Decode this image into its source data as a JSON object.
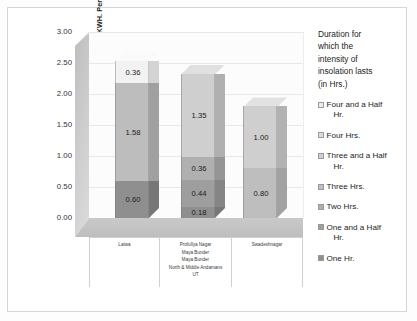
{
  "chart_data": {
    "type": "bar",
    "subtype": "stacked-3d-column",
    "title": "",
    "ylabel": "Intensity of Solar Radiation in KWH. Per day",
    "xlabel": "",
    "ylim": [
      0,
      3.0
    ],
    "ytick_labels": [
      "3.00",
      "2.50",
      "2.00",
      "1.50",
      "1.00",
      "0.50",
      "0.00"
    ],
    "ytick_values": [
      3.0,
      2.5,
      2.0,
      1.5,
      1.0,
      0.5,
      0.0
    ],
    "grid": true,
    "legend_position": "right",
    "legend_title": "Duration for which the intensity of insolation lasts (in Hrs.)",
    "categories": [
      "Latwa",
      "Profullya Nagar",
      "Swadeshnagar"
    ],
    "category_hierarchy": [
      [
        "Latwa"
      ],
      [
        "Profullya Nagar",
        "Maya Bunder",
        "Maya Bunder",
        "North & Middle Andamans",
        "UT"
      ],
      [
        "Swadeshnagar"
      ]
    ],
    "series": [
      {
        "name": "One Hr.",
        "values": [
          0.6,
          0.18,
          0.8
        ],
        "color": "#8f8f8f"
      },
      {
        "name": "One and a Half Hr.",
        "values": [
          null,
          0.44,
          null
        ],
        "color": "#9e9e9e"
      },
      {
        "name": "Two Hrs.",
        "values": [
          null,
          0.36,
          null
        ],
        "color": "#b0b0b0"
      },
      {
        "name": "Three Hrs.",
        "values": [
          1.58,
          null,
          null
        ],
        "color": "#bdbdbd"
      },
      {
        "name": "Three and a Half Hr.",
        "values": [
          null,
          1.35,
          1.0
        ],
        "color": "#cccccc"
      },
      {
        "name": "Four Hrs.",
        "values": [
          null,
          null,
          null
        ],
        "color": "#dcdcdc"
      },
      {
        "name": "Four and a Half Hr.",
        "values": [
          0.36,
          null,
          null
        ],
        "color": "#f2f2f2"
      }
    ],
    "bars": [
      {
        "category": "Latwa",
        "total": 2.54,
        "segments": [
          {
            "label": "0.60",
            "value": 0.6,
            "series": "One Hr.",
            "color": "#8f8f8f",
            "side": "#777777",
            "top": "#a8a8a8"
          },
          {
            "label": "1.58",
            "value": 1.58,
            "series": "Three Hrs.",
            "color": "#bdbdbd",
            "side": "#a0a0a0",
            "top": "#d2d2d2"
          },
          {
            "label": "0.36",
            "value": 0.36,
            "series": "Four and a Half Hr.",
            "color": "#f2f2f2",
            "side": "#d3d3d3",
            "top": "#fafafa"
          }
        ]
      },
      {
        "category": "Profullya Nagar",
        "total": 2.33,
        "segments": [
          {
            "label": "0.18",
            "value": 0.18,
            "series": "One Hr.",
            "color": "#8f8f8f",
            "side": "#777777",
            "top": "#a8a8a8"
          },
          {
            "label": "0.44",
            "value": 0.44,
            "series": "One and a Half Hr.",
            "color": "#9e9e9e",
            "side": "#858585",
            "top": "#b4b4b4"
          },
          {
            "label": "0.36",
            "value": 0.36,
            "series": "Two Hrs.",
            "color": "#b0b0b0",
            "side": "#959595",
            "top": "#c6c6c6"
          },
          {
            "label": "1.35",
            "value": 1.35,
            "series": "Three and a Half Hr.",
            "color": "#cfcfcf",
            "side": "#b0b0b0",
            "top": "#e0e0e0"
          }
        ]
      },
      {
        "category": "Swadeshnagar",
        "total": 1.8,
        "segments": [
          {
            "label": "0.80",
            "value": 0.8,
            "series": "One Hr.",
            "color": "#bebebe",
            "side": "#a2a2a2",
            "top": "#d2d2d2"
          },
          {
            "label": "1.00",
            "value": 1.0,
            "series": "Three and a Half Hr.",
            "color": "#cfcfcf",
            "side": "#b2b2b2",
            "top": "#e2e2e2"
          }
        ]
      }
    ]
  },
  "legend": {
    "title_lines": [
      "Duration for",
      "which the",
      "intensity of",
      "insolation lasts",
      "(in Hrs.)"
    ],
    "items": [
      {
        "label": "Four and a Half",
        "label_cont": "Hr.",
        "color": "#ececec"
      },
      {
        "label": "Four Hrs.",
        "label_cont": "",
        "color": "#dcdcdc"
      },
      {
        "label": "Three and a Half",
        "label_cont": "Hr.",
        "color": "#cfcfcf"
      },
      {
        "label": "Three Hrs.",
        "label_cont": "",
        "color": "#c0c0c0"
      },
      {
        "label": "Two Hrs.",
        "label_cont": "",
        "color": "#b0b0b0"
      },
      {
        "label": "One and a Half",
        "label_cont": "Hr.",
        "color": "#9e9e9e"
      },
      {
        "label": "One Hr.",
        "label_cont": "",
        "color": "#8f8f8f"
      }
    ]
  },
  "axis": {
    "y_title": "Intensity of Solar Radiation in KWH. Per day"
  }
}
